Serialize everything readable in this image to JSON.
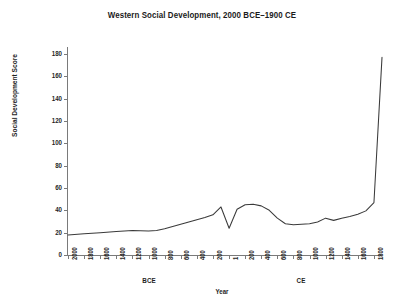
{
  "chart_data": {
    "type": "line",
    "title": "Western Social Development, 2000 BCE–1900 CE",
    "xlabel": "Year",
    "ylabel": "Social Development Score",
    "ylim": [
      0,
      185
    ],
    "yticks": [
      0,
      20,
      40,
      60,
      80,
      100,
      120,
      140,
      160,
      180
    ],
    "grid": false,
    "legend": null,
    "era_labels": [
      {
        "text": "BCE",
        "at_year": -1000
      },
      {
        "text": "CE",
        "at_year": 900
      }
    ],
    "xtick_labels": [
      "2000",
      "1800",
      "1600",
      "1400",
      "1200",
      "1000",
      "800",
      "600",
      "400",
      "200",
      "1",
      "200",
      "400",
      "600",
      "800",
      "1000",
      "1200",
      "1400",
      "1600",
      "1800"
    ],
    "xtick_years": [
      -2000,
      -1800,
      -1600,
      -1400,
      -1200,
      -1000,
      -800,
      -600,
      -400,
      -200,
      1,
      200,
      400,
      600,
      800,
      1000,
      1200,
      1400,
      1600,
      1800
    ],
    "x": [
      -2000,
      -1800,
      -1600,
      -1400,
      -1200,
      -1000,
      -900,
      -800,
      -700,
      -600,
      -500,
      -400,
      -300,
      -200,
      -100,
      1,
      100,
      200,
      300,
      400,
      500,
      600,
      700,
      800,
      900,
      1000,
      1100,
      1200,
      1300,
      1400,
      1500,
      1600,
      1700,
      1800,
      1900
    ],
    "values": [
      18,
      19,
      20,
      21,
      22,
      21.5,
      22,
      23.5,
      25.5,
      27.5,
      29.5,
      31.5,
      33.5,
      36,
      43,
      24,
      41,
      45,
      45.5,
      44,
      40,
      33,
      28,
      27,
      27.5,
      28,
      29.5,
      33,
      31,
      33,
      34.5,
      36.5,
      39.5,
      47,
      177
    ],
    "series": [
      {
        "name": "Western social development score",
        "values": [
          18,
          19,
          20,
          21,
          22,
          21.5,
          22,
          23.5,
          25.5,
          27.5,
          29.5,
          31.5,
          33.5,
          36,
          43,
          24,
          41,
          45,
          45.5,
          44,
          40,
          33,
          28,
          27,
          27.5,
          28,
          29.5,
          33,
          31,
          33,
          34.5,
          36.5,
          39.5,
          47,
          177
        ]
      }
    ],
    "line_color": "#3a3a3a",
    "annotations": [
      {
        "text": "peak at 1900 CE",
        "year": 1900,
        "value": 177
      },
      {
        "text": "collapse dip near 1 CE",
        "year": 1,
        "value": 24
      },
      {
        "text": "Roman plateau",
        "year": 300,
        "value": 45.5
      }
    ]
  }
}
